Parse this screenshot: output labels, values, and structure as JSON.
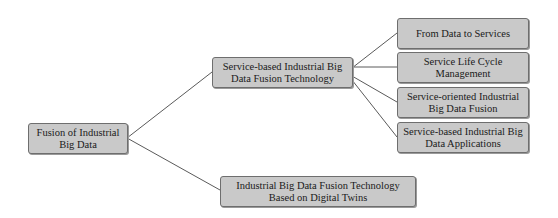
{
  "diagram": {
    "type": "tree",
    "root": {
      "label": "Fusion of Industrial Big Data",
      "children": [
        {
          "label": "Service-based Industrial Big Data Fusion Technology",
          "children": [
            {
              "label": "From Data to Services"
            },
            {
              "label": "Service Life Cycle Management"
            },
            {
              "label": "Service-oriented Industrial Big Data Fusion"
            },
            {
              "label": "Service-based Industrial Big Data Applications"
            }
          ]
        },
        {
          "label": "Industrial Big Data Fusion Technology Based on Digital Twins"
        }
      ]
    }
  },
  "nodes": {
    "root": "Fusion of Industrial Big Data",
    "service_based": "Service-based Industrial Big Data Fusion Technology",
    "from_data": "From Data to Services",
    "life_cycle": "Service Life Cycle Management",
    "service_oriented": "Service-oriented Industrial Big Data Fusion",
    "service_apps": "Service-based Industrial Big Data Applications",
    "digital_twins": "Industrial Big Data Fusion Technology Based on Digital Twins"
  },
  "colors": {
    "node_fill": "#c9c9c9",
    "node_border": "#6e6e6e",
    "connector": "#5a5a5a"
  }
}
